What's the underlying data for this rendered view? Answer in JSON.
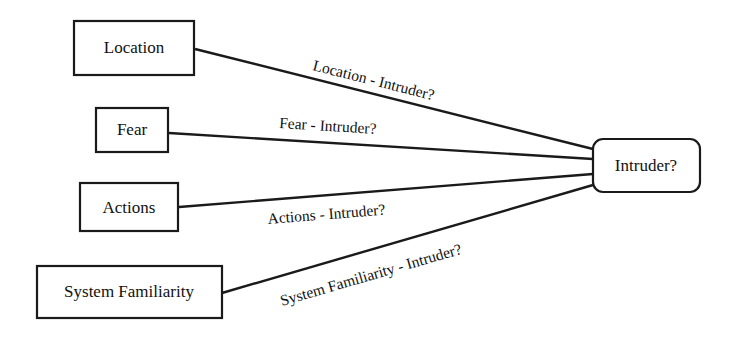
{
  "diagram": {
    "type": "bayesian-network",
    "nodes": [
      {
        "id": "location",
        "label": "Location",
        "shape": "rect"
      },
      {
        "id": "fear",
        "label": "Fear",
        "shape": "rect"
      },
      {
        "id": "actions",
        "label": "Actions",
        "shape": "rect"
      },
      {
        "id": "system_familiarity",
        "label": "System Familiarity",
        "shape": "rect"
      },
      {
        "id": "intruder",
        "label": "Intruder?",
        "shape": "rounded-rect"
      }
    ],
    "edges": [
      {
        "from": "location",
        "to": "intruder",
        "label": "Location - Intruder?"
      },
      {
        "from": "fear",
        "to": "intruder",
        "label": "Fear - Intruder?"
      },
      {
        "from": "actions",
        "to": "intruder",
        "label": "Actions - Intruder?"
      },
      {
        "from": "system_familiarity",
        "to": "intruder",
        "label": "System Familiarity - Intruder?"
      }
    ],
    "colors": {
      "stroke": "#1a1a1a",
      "text": "#111111",
      "background": "#ffffff"
    }
  }
}
